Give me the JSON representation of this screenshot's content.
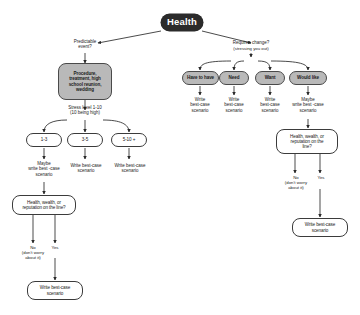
{
  "diagram": {
    "colors": {
      "root_fill": "#2b2b2b",
      "root_text": "#ffffff",
      "gray_fill": "#b9b9b9",
      "stroke": "#3b3b3b",
      "background": "#ffffff",
      "text": "#1c1c1c"
    },
    "root": {
      "label": "Health"
    },
    "left_branch": {
      "question": "Predictable\nevent?",
      "category": "Procedure,\ntreatment, high\nschool reunion,\nwedding",
      "scale_label": "Stress level 1-10\n(10 being high)",
      "levels": [
        {
          "label": "1-3",
          "action": "Maybe\nwrite best -case\nscenario"
        },
        {
          "label": "3-5",
          "action": "Write best-case\nscenario"
        },
        {
          "label": "5-10 +",
          "action": "Write best-case\nscenario"
        }
      ],
      "stakes_question": "Health, wealth, or\nreputation on the line?",
      "no_label": "No\n(don't worry\nabout it)",
      "yes_label": "Yes",
      "outcome": "Write best-case\nscenario"
    },
    "right_branch": {
      "question": "Requires change?",
      "subtext": "(stressing you out)",
      "options": [
        {
          "label": "Have to have",
          "action": "Write\nbest-case\nscenario"
        },
        {
          "label": "Need",
          "action": "Write\nbest-case\nscenario"
        },
        {
          "label": "Want",
          "action": "Write\nbest-case\nscenario"
        },
        {
          "label": "Would like",
          "action": "Maybe\nwrite best -case\nscenario"
        }
      ],
      "stakes_question": "Health, wealth, or\nreputation on the\nline?",
      "no_label": "No\n(don't worry\nabout it)",
      "yes_label": "Yes",
      "outcome": "Write best-case\nscenario"
    }
  }
}
